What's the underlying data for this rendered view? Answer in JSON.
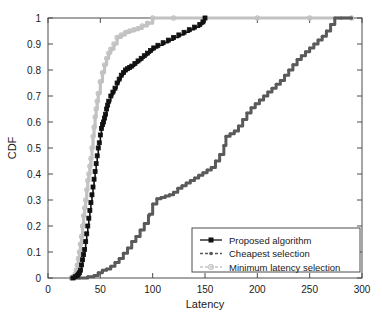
{
  "chart_data": {
    "type": "line",
    "title": "",
    "xlabel": "Latency",
    "ylabel": "CDF",
    "xlim": [
      0,
      300
    ],
    "ylim": [
      0,
      1
    ],
    "xticks": [
      0,
      50,
      100,
      150,
      200,
      250,
      300
    ],
    "xticklabels": [
      "0",
      "50",
      "100",
      "150",
      "200",
      "250",
      "300"
    ],
    "yticks": [
      0,
      0.1,
      0.2,
      0.3,
      0.4,
      0.5,
      0.6,
      0.7,
      0.8,
      0.9,
      1
    ],
    "yticklabels": [
      "0",
      "0.1",
      "0.2",
      "0.3",
      "0.4",
      "0.5",
      "0.6",
      "0.7",
      "0.8",
      "0.9",
      "1"
    ],
    "grid": false,
    "legend_position": "lower right",
    "series": [
      {
        "name": "Proposed algorithm",
        "color": "#111111",
        "marker": "square",
        "linestyle": "solid",
        "x": [
          24,
          26,
          28,
          29,
          30,
          31,
          32,
          33,
          34,
          35,
          36,
          37,
          38,
          39,
          40,
          41,
          42,
          43,
          44,
          45,
          46,
          47,
          48,
          49,
          50,
          51,
          52,
          53,
          54,
          55,
          56,
          57,
          58,
          60,
          62,
          64,
          66,
          68,
          70,
          72,
          74,
          76,
          78,
          80,
          83,
          86,
          89,
          92,
          95,
          98,
          101,
          105,
          110,
          115,
          120,
          125,
          130,
          135,
          140,
          145,
          148,
          150
        ],
        "y": [
          0.0,
          0.005,
          0.01,
          0.015,
          0.02,
          0.03,
          0.05,
          0.07,
          0.09,
          0.11,
          0.14,
          0.17,
          0.2,
          0.23,
          0.26,
          0.29,
          0.32,
          0.35,
          0.38,
          0.41,
          0.44,
          0.47,
          0.5,
          0.52,
          0.55,
          0.575,
          0.59,
          0.6,
          0.615,
          0.63,
          0.65,
          0.665,
          0.68,
          0.7,
          0.715,
          0.73,
          0.75,
          0.765,
          0.78,
          0.79,
          0.8,
          0.805,
          0.81,
          0.815,
          0.825,
          0.835,
          0.845,
          0.855,
          0.865,
          0.875,
          0.885,
          0.895,
          0.905,
          0.915,
          0.925,
          0.935,
          0.945,
          0.955,
          0.965,
          0.975,
          0.985,
          1.0
        ]
      },
      {
        "name": "Cheapest selection",
        "color": "#5a5a5a",
        "marker": "dot",
        "linestyle": "dashed",
        "x": [
          22,
          30,
          38,
          44,
          48,
          52,
          56,
          60,
          64,
          68,
          72,
          76,
          80,
          84,
          88,
          92,
          96,
          97,
          100,
          104,
          108,
          112,
          116,
          120,
          124,
          128,
          132,
          136,
          140,
          144,
          148,
          152,
          156,
          160,
          164,
          168,
          170,
          174,
          178,
          182,
          186,
          190,
          194,
          198,
          202,
          206,
          210,
          214,
          218,
          222,
          226,
          230,
          234,
          238,
          242,
          246,
          250,
          254,
          258,
          262,
          266,
          270,
          274,
          280,
          290
        ],
        "y": [
          0.0,
          0.0,
          0.005,
          0.01,
          0.02,
          0.03,
          0.035,
          0.045,
          0.06,
          0.075,
          0.095,
          0.115,
          0.14,
          0.16,
          0.185,
          0.21,
          0.24,
          0.245,
          0.285,
          0.305,
          0.31,
          0.315,
          0.32,
          0.33,
          0.345,
          0.355,
          0.365,
          0.375,
          0.385,
          0.395,
          0.405,
          0.415,
          0.425,
          0.45,
          0.475,
          0.51,
          0.545,
          0.555,
          0.565,
          0.585,
          0.61,
          0.635,
          0.655,
          0.67,
          0.685,
          0.7,
          0.715,
          0.73,
          0.745,
          0.76,
          0.78,
          0.8,
          0.82,
          0.84,
          0.855,
          0.87,
          0.885,
          0.9,
          0.915,
          0.93,
          0.95,
          0.975,
          1.0,
          1.0,
          1.0
        ]
      },
      {
        "name": "Minimum latency selection",
        "color": "#c2c2c2",
        "marker": "circle",
        "linestyle": "dashed",
        "x": [
          22,
          24,
          26,
          27,
          28,
          29,
          30,
          31,
          32,
          33,
          34,
          35,
          36,
          37,
          38,
          39,
          40,
          41,
          42,
          43,
          44,
          45,
          46,
          47,
          48,
          50,
          52,
          54,
          56,
          58,
          60,
          63,
          66,
          70,
          74,
          78,
          82,
          86,
          90,
          95,
          100,
          120,
          150,
          200,
          250,
          290
        ],
        "y": [
          0.0,
          0.005,
          0.015,
          0.03,
          0.05,
          0.075,
          0.1,
          0.13,
          0.16,
          0.2,
          0.24,
          0.27,
          0.3,
          0.34,
          0.375,
          0.4,
          0.43,
          0.46,
          0.5,
          0.545,
          0.58,
          0.62,
          0.65,
          0.68,
          0.71,
          0.755,
          0.79,
          0.82,
          0.845,
          0.865,
          0.88,
          0.9,
          0.925,
          0.935,
          0.945,
          0.95,
          0.955,
          0.96,
          0.97,
          0.98,
          1.0,
          1.0,
          1.0,
          1.0,
          1.0,
          1.0
        ]
      }
    ]
  },
  "legend": {
    "entries": [
      {
        "label": "Proposed algorithm"
      },
      {
        "label": "Cheapest selection"
      },
      {
        "label": "Minimum latency selection"
      }
    ]
  }
}
